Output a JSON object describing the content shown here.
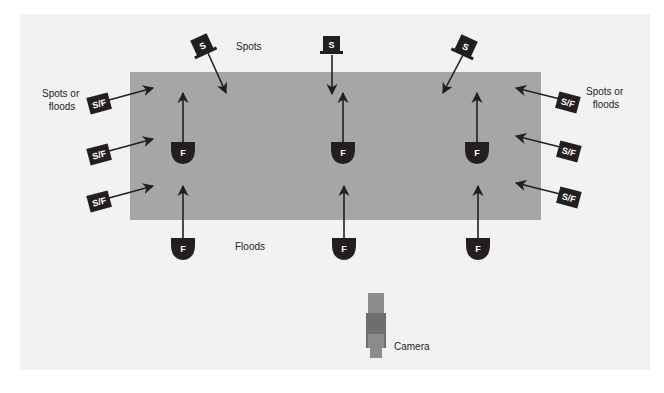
{
  "diagram": {
    "colors": {
      "panel": "#f2f2f2",
      "stage": "#a6a6a6",
      "fixture": "#231f20",
      "fixture_text": "#ffffff",
      "camera_light": "#8c8c8c",
      "camera_dark": "#6e6e6e"
    },
    "labels": {
      "spots": "Spots",
      "floods": "Floods",
      "spots_or_floods_left_line1": "Spots or",
      "spots_or_floods_left_line2": "floods",
      "spots_or_floods_right_line1": "Spots or",
      "spots_or_floods_right_line2": "floods",
      "camera": "Camera"
    },
    "fixture_glyphs": {
      "spot": "S",
      "flood": "F",
      "spot_or_flood": "S/F"
    },
    "fixtures": {
      "spots": [
        {
          "id": "spot-left",
          "label": "S"
        },
        {
          "id": "spot-center",
          "label": "S"
        },
        {
          "id": "spot-right",
          "label": "S"
        }
      ],
      "floods_inside": [
        {
          "id": "flood-in-left",
          "label": "F"
        },
        {
          "id": "flood-in-center",
          "label": "F"
        },
        {
          "id": "flood-in-right",
          "label": "F"
        }
      ],
      "floods_front": [
        {
          "id": "flood-front-left",
          "label": "F"
        },
        {
          "id": "flood-front-center",
          "label": "F"
        },
        {
          "id": "flood-front-right",
          "label": "F"
        }
      ],
      "side_left": [
        {
          "id": "sf-left-1",
          "label": "S/F"
        },
        {
          "id": "sf-left-2",
          "label": "S/F"
        },
        {
          "id": "sf-left-3",
          "label": "S/F"
        }
      ],
      "side_right": [
        {
          "id": "sf-right-1",
          "label": "S/F"
        },
        {
          "id": "sf-right-2",
          "label": "S/F"
        },
        {
          "id": "sf-right-3",
          "label": "S/F"
        }
      ]
    }
  }
}
